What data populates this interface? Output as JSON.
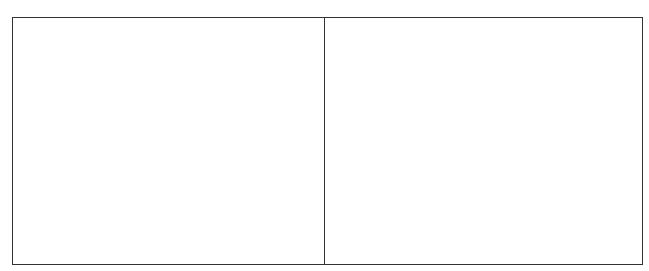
{
  "caption": {
    "text": ""
  },
  "frame": {
    "border_color": "#333333",
    "background": "#ffffff",
    "panels": [
      {
        "id": "left",
        "content": ""
      },
      {
        "id": "right",
        "content": ""
      }
    ]
  }
}
